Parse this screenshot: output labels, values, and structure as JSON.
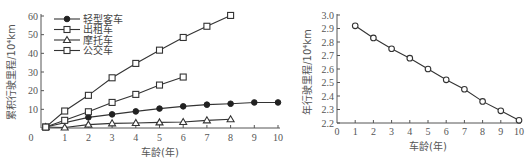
{
  "chart_data": [
    {
      "type": "line",
      "title": "",
      "xlabel": "车龄(年)",
      "ylabel": "累积行驶里程/10⁴km",
      "xlim": [
        0,
        10
      ],
      "ylim": [
        0,
        60
      ],
      "x_ticks": [
        0,
        1,
        2,
        3,
        4,
        5,
        6,
        7,
        8,
        9,
        10
      ],
      "y_ticks": [
        10,
        20,
        30,
        40,
        50,
        60
      ],
      "grid": false,
      "legend_position": "upper left",
      "series": [
        {
          "name": "轻型客车",
          "marker": "filled-circle",
          "x": [
            0.2,
            2,
            3,
            4,
            5,
            6,
            7,
            8,
            9,
            10
          ],
          "values": [
            0.5,
            5.7,
            7.3,
            8.9,
            10.4,
            11.6,
            12.5,
            13.0,
            13.7,
            13.7
          ]
        },
        {
          "name": "出租车",
          "marker": "open-square",
          "x": [
            0.2,
            1,
            2,
            3,
            4,
            5,
            6
          ],
          "values": [
            0.5,
            4.1,
            8.7,
            13.7,
            18.0,
            23.0,
            27.3
          ]
        },
        {
          "name": "摩托车",
          "marker": "open-triangle",
          "x": [
            0.2,
            1,
            2,
            3,
            4,
            5,
            6,
            7,
            8
          ],
          "values": [
            0.5,
            0.3,
            1.8,
            2.5,
            2.7,
            3.0,
            3.2,
            4.1,
            4.7
          ]
        },
        {
          "name": "公交车",
          "marker": "open-square",
          "x": [
            0.2,
            1,
            2,
            3,
            4,
            5,
            6,
            7,
            8
          ],
          "values": [
            0.5,
            9.1,
            17.5,
            26.9,
            34.6,
            41.7,
            48.5,
            54.5,
            60.3
          ]
        }
      ]
    },
    {
      "type": "line",
      "title": "",
      "xlabel": "车龄(年)",
      "ylabel": "年行驶里程/10⁴km",
      "xlim": [
        0,
        10
      ],
      "ylim": [
        2.2,
        3.0
      ],
      "x_ticks": [
        0,
        1,
        2,
        3,
        4,
        5,
        6,
        7,
        8,
        9,
        10
      ],
      "y_ticks": [
        2.2,
        2.3,
        2.4,
        2.5,
        2.6,
        2.7,
        2.8,
        2.9,
        3.0
      ],
      "grid": false,
      "series": [
        {
          "name": "年行驶里程",
          "marker": "open-circle",
          "x": [
            1,
            2,
            3,
            4,
            5,
            6,
            7,
            8,
            9,
            10
          ],
          "values": [
            2.92,
            2.83,
            2.75,
            2.68,
            2.6,
            2.52,
            2.45,
            2.36,
            2.29,
            2.22
          ]
        }
      ]
    }
  ],
  "left": {
    "xlabel": "车龄(年)",
    "ylabel": "累积行驶里程/10⁴km",
    "legend": [
      "轻型客车",
      "出租车",
      "摩托车",
      "公交车"
    ]
  },
  "right": {
    "xlabel": "车龄(年)",
    "ylabel": "年行驶里程/10⁴km"
  }
}
